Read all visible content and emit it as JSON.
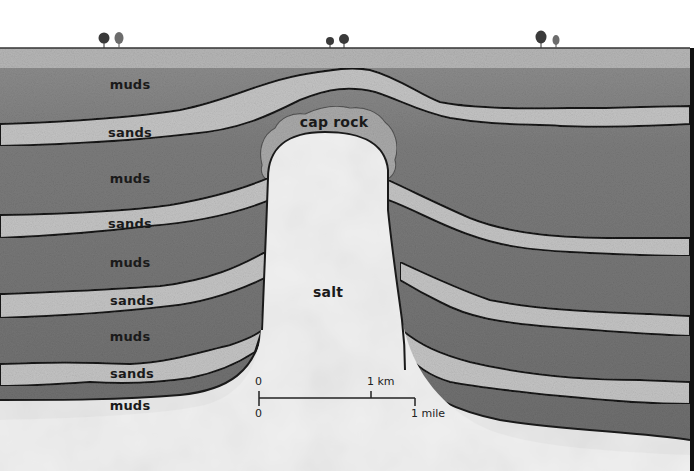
{
  "diagram": {
    "colors": {
      "sky": "#ffffff",
      "surface_band": "#b4b4b4",
      "muds": "#7a7a7a",
      "muds_upper": "#8c8c8c",
      "sands": "#c4c4c4",
      "cap_rock": "#a8a8a8",
      "salt": "#efefef",
      "bottom_fill": "#e6e6e6",
      "outline": "#1a1a1a",
      "tree_dark": "#3a3a3a",
      "tree_light": "#6c6c6c"
    },
    "trees": [
      {
        "x": 104,
        "kind": "dark"
      },
      {
        "x": 119,
        "kind": "light"
      },
      {
        "x": 329,
        "kind": "dark-small"
      },
      {
        "x": 344,
        "kind": "dark"
      },
      {
        "x": 541,
        "kind": "dark"
      },
      {
        "x": 556,
        "kind": "light-small"
      }
    ],
    "labels": {
      "muds_1": "muds",
      "sands_1": "sands",
      "muds_2": "muds",
      "sands_2": "sands",
      "muds_3": "muds",
      "sands_3": "sands",
      "muds_4": "muds",
      "sands_4": "sands",
      "muds_5": "muds",
      "cap_rock": "cap rock",
      "salt": "salt"
    },
    "scale_bar": {
      "km_start": "0",
      "km_end": "1 km",
      "mile_start": "0",
      "mile_end": "1 mile"
    }
  }
}
